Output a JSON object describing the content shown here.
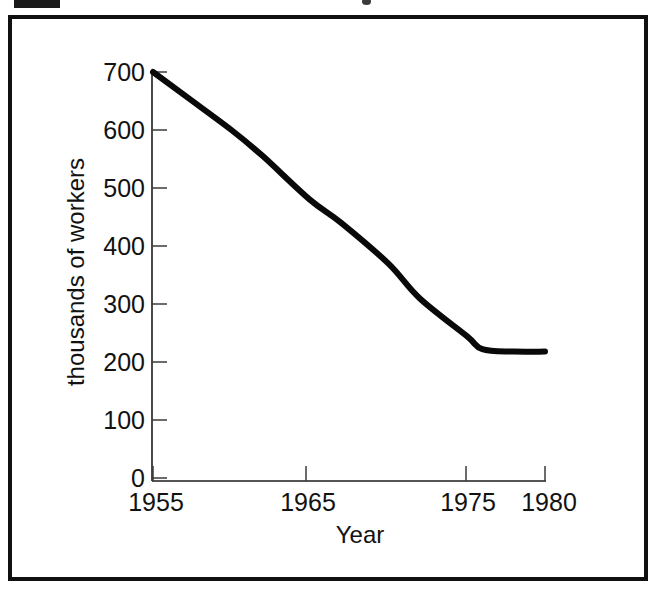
{
  "figure": {
    "frame_color": "#101010",
    "background": "#ffffff"
  },
  "marks": {
    "top_left_marker": "",
    "top_right_speck": ""
  },
  "chart_data": {
    "type": "line",
    "title": "",
    "xlabel": "Year",
    "ylabel": "thousands of workers",
    "x": [
      1955,
      1957,
      1960,
      1962,
      1965,
      1967,
      1970,
      1972,
      1975,
      1976,
      1978,
      1980
    ],
    "values": [
      700,
      660,
      600,
      555,
      480,
      440,
      370,
      310,
      245,
      222,
      218,
      218
    ],
    "series": [
      {
        "name": "thousands of workers",
        "x": [
          1955,
          1957,
          1960,
          1962,
          1965,
          1967,
          1970,
          1972,
          1975,
          1976,
          1978,
          1980
        ],
        "values": [
          700,
          660,
          600,
          555,
          480,
          440,
          370,
          310,
          245,
          222,
          218,
          218
        ],
        "color": "#090909"
      }
    ],
    "xticks": [
      1955,
      1965,
      1975,
      1980
    ],
    "xtick_labels": [
      "1955",
      "1965",
      "1975",
      "1980"
    ],
    "yticks": [
      0,
      100,
      200,
      300,
      400,
      500,
      600,
      700
    ],
    "ytick_labels": [
      "0",
      "100",
      "200",
      "300",
      "400",
      "500",
      "600",
      "700"
    ],
    "xlim": [
      1955,
      1980
    ],
    "ylim": [
      0,
      700
    ],
    "grid": false,
    "legend": false,
    "line_color": "#090909",
    "axis_color": "#1c1c1c"
  }
}
